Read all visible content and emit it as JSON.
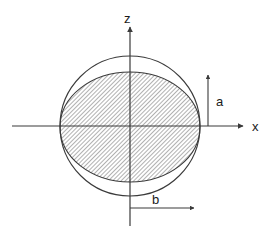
{
  "figure": {
    "title": "",
    "type": "geometry-diagram",
    "background_color": "#ffffff",
    "stroke_color": "#3a3a3a",
    "hatch_color": "#8a8a8a",
    "fill_color": "#d9d9d9"
  },
  "axes": {
    "horizontal": {
      "name": "x-axis",
      "label": "x",
      "label_x": 252,
      "label_y": 131,
      "start_x": 12,
      "end_x": 243,
      "y": 126,
      "arrow": "right"
    },
    "vertical": {
      "name": "z-axis",
      "label": "z",
      "label_x": 124,
      "label_y": 23,
      "x": 130,
      "start_y": 226,
      "end_y": 27,
      "arrow": "up"
    },
    "origin": {
      "x": 130,
      "y": 126
    }
  },
  "shapes": {
    "circle": {
      "name": "outer-circle",
      "cx": 130,
      "cy": 126,
      "r": 70,
      "filled": false,
      "stroke": "#3a3a3a"
    },
    "ellipse": {
      "name": "inner-ellipse",
      "cx": 130,
      "cy": 127,
      "rx": 70,
      "ry": 55,
      "filled": true,
      "hatched": true,
      "stroke": "#3a3a3a"
    }
  },
  "dimensions": [
    {
      "name": "dimension-a",
      "label": "a",
      "orientation": "vertical",
      "x": 208,
      "from_y": 126,
      "to_y": 75,
      "label_x": 216,
      "label_y": 106,
      "arrow": "up",
      "meaning": "semi-minor axis"
    },
    {
      "name": "dimension-b",
      "label": "b",
      "orientation": "horizontal",
      "y": 208,
      "from_x": 130,
      "to_x": 194,
      "label_x": 152,
      "label_y": 204,
      "arrow": "right",
      "meaning": "semi-major axis"
    }
  ]
}
